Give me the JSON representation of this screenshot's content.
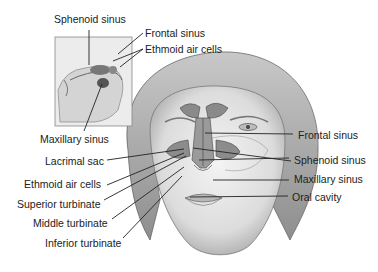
{
  "inset": {
    "labels": [
      {
        "id": "sphenoid",
        "text": "Sphenoid sinus"
      },
      {
        "id": "frontal",
        "text": "Frontal sinus"
      },
      {
        "id": "ethmoid",
        "text": "Ethmoid air cells"
      },
      {
        "id": "maxillary",
        "text": "Maxillary sinus"
      }
    ]
  },
  "left_labels": [
    {
      "id": "lacrimal",
      "text": "Lacrimal sac"
    },
    {
      "id": "ethmoid",
      "text": "Ethmoid air cells"
    },
    {
      "id": "superior",
      "text": "Superior turbinate"
    },
    {
      "id": "middle",
      "text": "Middle turbinate"
    },
    {
      "id": "inferior",
      "text": "Inferior turbinate"
    }
  ],
  "right_labels": [
    {
      "id": "frontal",
      "text": "Frontal sinus"
    },
    {
      "id": "sphenoid",
      "text": "Sphenoid sinus"
    },
    {
      "id": "maxillary",
      "text": "Maxillary sinus"
    },
    {
      "id": "oral",
      "text": "Oral cavity"
    }
  ]
}
